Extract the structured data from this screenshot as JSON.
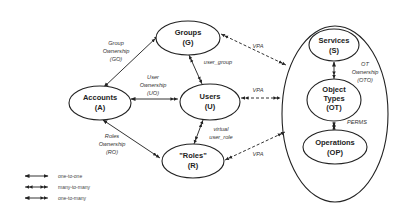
{
  "nodes": {
    "accounts": {
      "name": "Accounts",
      "abbr": "(A)"
    },
    "groups": {
      "name": "Groups",
      "abbr": "(G)"
    },
    "users": {
      "name": "Users",
      "abbr": "(U)"
    },
    "roles": {
      "name": "\"Roles\"",
      "abbr": "(R)"
    },
    "services": {
      "name": "Services",
      "abbr": "(S)"
    },
    "object_types": {
      "line1": "Object",
      "line2": "Types",
      "abbr": "(OT)"
    },
    "operations": {
      "name": "Operations",
      "abbr": "(OP)"
    }
  },
  "edges": {
    "group_ownership": {
      "line1": "Group",
      "line2": "Ownership",
      "line3": "(GO)"
    },
    "user_ownership": {
      "line1": "User",
      "line2": "Ownership",
      "line3": "(UO)"
    },
    "roles_ownership": {
      "line1": "Roles",
      "line2": "Ownership",
      "line3": "(RO)"
    },
    "user_group": {
      "label": "user_group"
    },
    "virtual_user_role": {
      "line1": "virtual",
      "line2": "user_role"
    },
    "vpa_groups": {
      "label": "VPA"
    },
    "vpa_users": {
      "label": "VPA"
    },
    "vpa_roles": {
      "label": "VPA"
    },
    "ot_ownership": {
      "line1": "OT",
      "line2": "Ownership",
      "line3": "(OTO)"
    },
    "perms": {
      "label": "PERMS"
    }
  },
  "legend": {
    "items": [
      {
        "label": "one-to-one"
      },
      {
        "label": "many-to-many"
      },
      {
        "label": "one-to-many"
      }
    ]
  }
}
